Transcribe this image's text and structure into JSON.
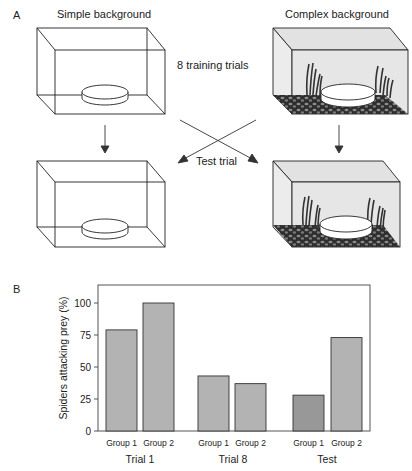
{
  "panel_a": {
    "label": "A",
    "simple_title": "Simple background",
    "complex_title": "Complex background",
    "training_label": "8 training trials",
    "test_label": "Test trial"
  },
  "panel_b": {
    "label": "B"
  },
  "colors": {
    "bar": "#b3b3b3",
    "bar_highlight": "#989898",
    "complex_bg": "#e6e6e6",
    "gravel": "#3a3a3a",
    "stroke": "#222222"
  },
  "chart_data": {
    "type": "bar",
    "title": "",
    "ylabel": "Spiders  attacking prey (%)",
    "xlabel": "",
    "ylim": [
      0,
      112
    ],
    "yticks": [
      0,
      25,
      50,
      75,
      100
    ],
    "grid": false,
    "legend": null,
    "groups": [
      "Trial 1",
      "Trial 8",
      "Test"
    ],
    "categories": [
      "Group 1",
      "Group 2",
      "Group 1",
      "Group 2",
      "Group 1",
      "Group 2"
    ],
    "series": [
      {
        "group": "Trial 1",
        "name": "Group 1",
        "value": 79
      },
      {
        "group": "Trial 1",
        "name": "Group 2",
        "value": 100
      },
      {
        "group": "Trial 8",
        "name": "Group 1",
        "value": 43
      },
      {
        "group": "Trial 8",
        "name": "Group 2",
        "value": 37
      },
      {
        "group": "Test",
        "name": "Group 1",
        "value": 28
      },
      {
        "group": "Test",
        "name": "Group 2",
        "value": 73
      }
    ],
    "values": [
      79,
      100,
      43,
      37,
      28,
      73
    ]
  }
}
